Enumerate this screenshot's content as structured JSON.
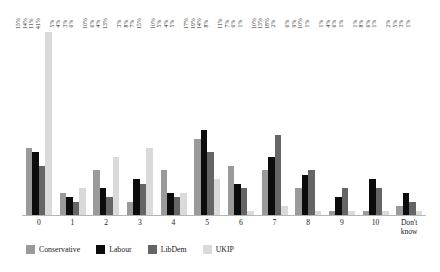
{
  "chart_data": {
    "type": "bar",
    "title": "",
    "subtitle": "",
    "xlabel": "",
    "ylabel": "",
    "ylim": [
      0,
      45
    ],
    "grid": false,
    "legend_position": "bottom-left",
    "categories": [
      "0",
      "1",
      "2",
      "3",
      "4",
      "5",
      "6",
      "7",
      "8",
      "9",
      "10",
      "Don't know"
    ],
    "value_suffix": "%",
    "series": [
      {
        "name": "Conservative",
        "color": "#9a9a9a",
        "values": [
          15,
          5,
          10,
          3,
          10,
          17,
          11,
          10,
          6,
          1,
          1,
          2
        ],
        "labels": [
          "15%",
          "5%",
          "10%",
          "3%",
          "10%",
          "17%",
          "11%",
          "10%",
          "6%",
          "1%",
          "1%",
          "2%"
        ]
      },
      {
        "name": "Labour",
        "color": "#0c0c0c",
        "values": [
          14,
          4,
          6,
          8,
          5,
          19,
          7,
          13,
          9,
          4,
          8,
          5
        ],
        "labels": [
          "14%",
          "4%",
          "6%",
          "8%",
          "5%",
          "19%",
          "7%",
          "13%",
          "9%",
          "4%",
          "8%",
          "5%"
        ]
      },
      {
        "name": "LibDem",
        "color": "#656565",
        "values": [
          11,
          3,
          4,
          7,
          4,
          14,
          6,
          18,
          10,
          6,
          6,
          3
        ],
        "labels": [
          "11%",
          "3%",
          "4%",
          "7%",
          "4%",
          "14%",
          "6%",
          "18%",
          "10%",
          "6%",
          "6%",
          "3%"
        ]
      },
      {
        "name": "UKIP",
        "color": "#dadada",
        "values": [
          41,
          6,
          13,
          15,
          5,
          8,
          1,
          2,
          1,
          1,
          1,
          1
        ],
        "labels": [
          "41%",
          "6%",
          "13%",
          "15%",
          "5%",
          "8%",
          "1%",
          "2%",
          "1%",
          "1%",
          "1%",
          "1%"
        ]
      }
    ]
  }
}
